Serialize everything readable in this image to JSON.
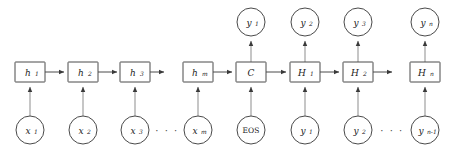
{
  "diagram": {
    "type": "diagram",
    "canvas": {
      "width": 454,
      "height": 149
    },
    "colors": {
      "background": "#ffffff",
      "stroke": "#4a4a4a",
      "vertical_edge": "#8d8d8d",
      "text": "#1a1a1a"
    },
    "rows": {
      "outputs_label": "outputs",
      "hidden_label": "hidden states",
      "inputs_label": "inputs"
    },
    "columns": [
      {
        "id": "col-1",
        "center_x": 30,
        "hidden": {
          "name": "h-1-box",
          "base": "h",
          "sub": "1",
          "style": "italic"
        },
        "input": {
          "name": "x-1-circle",
          "base": "x",
          "sub": "1",
          "style": "italic"
        },
        "output": null,
        "forward_arrow": true
      },
      {
        "id": "col-2",
        "center_x": 83,
        "hidden": {
          "name": "h-2-box",
          "base": "h",
          "sub": "2",
          "style": "italic"
        },
        "input": {
          "name": "x-2-circle",
          "base": "x",
          "sub": "2",
          "style": "italic"
        },
        "output": null,
        "forward_arrow": true
      },
      {
        "id": "col-3",
        "center_x": 135,
        "hidden": {
          "name": "h-3-box",
          "base": "h",
          "sub": "3",
          "style": "italic"
        },
        "input": {
          "name": "x-3-circle",
          "base": "x",
          "sub": "3",
          "style": "italic"
        },
        "output": null,
        "forward_arrow": true
      },
      {
        "id": "col-4",
        "center_x": 198,
        "hidden": {
          "name": "h-m-box",
          "base": "h",
          "sub": "m",
          "style": "italic"
        },
        "input": {
          "name": "x-m-circle",
          "base": "x",
          "sub": "m",
          "style": "italic"
        },
        "output": null,
        "forward_arrow": true
      },
      {
        "id": "col-5",
        "center_x": 251,
        "hidden": {
          "name": "c-box",
          "base": "C",
          "sub": "",
          "style": "italic"
        },
        "input": {
          "name": "eos-circle",
          "base": "EOS",
          "sub": "",
          "style": "upright"
        },
        "output": {
          "name": "y-1-out-circle",
          "base": "y",
          "sub": "1",
          "style": "italic"
        },
        "forward_arrow": true
      },
      {
        "id": "col-6",
        "center_x": 305,
        "hidden": {
          "name": "H-1-box",
          "base": "H",
          "sub": "1",
          "style": "italic"
        },
        "input": {
          "name": "y-1-in-circle",
          "base": "y",
          "sub": "1",
          "style": "italic"
        },
        "output": {
          "name": "y-2-out-circle",
          "base": "y",
          "sub": "2",
          "style": "italic"
        },
        "forward_arrow": true
      },
      {
        "id": "col-7",
        "center_x": 358,
        "hidden": {
          "name": "H-2-box",
          "base": "H",
          "sub": "2",
          "style": "italic"
        },
        "input": {
          "name": "y-2-in-circle",
          "base": "y",
          "sub": "2",
          "style": "italic"
        },
        "output": {
          "name": "y-3-out-circle",
          "base": "y",
          "sub": "3",
          "style": "italic"
        },
        "forward_arrow": true
      },
      {
        "id": "col-8",
        "center_x": 425,
        "hidden": {
          "name": "H-n-box",
          "base": "H",
          "sub": "n",
          "style": "italic"
        },
        "input": {
          "name": "y-nminus1-in-circle",
          "base": "y",
          "sub": "n-1",
          "style": "italic"
        },
        "output": {
          "name": "y-n-out-circle",
          "base": "y",
          "sub": "n",
          "style": "italic"
        },
        "forward_arrow": false
      }
    ],
    "ellipses": [
      {
        "name": "encoder-input-ellipsis",
        "x": 167,
        "y": 130,
        "text": "· · ·"
      },
      {
        "name": "decoder-input-ellipsis",
        "x": 392,
        "y": 130,
        "text": "· · ·"
      }
    ],
    "geometry": {
      "box": {
        "width": 30,
        "height": 20,
        "top": 62
      },
      "circle": {
        "radius": 14,
        "bottom_cy": 130,
        "top_cy": 22
      }
    }
  }
}
